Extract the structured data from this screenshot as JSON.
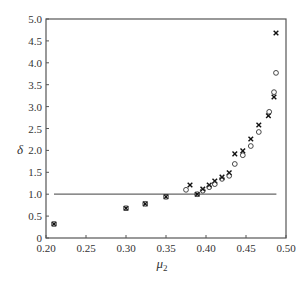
{
  "chart_data": {
    "type": "scatter",
    "title": "",
    "xlabel": "μ2",
    "ylabel": "δ",
    "xlim": [
      0.2,
      0.5
    ],
    "ylim": [
      0,
      5.0
    ],
    "x_ticks": [
      "0.20",
      "0.25",
      "0.30",
      "0.35",
      "0.40",
      "0.45",
      "0.50"
    ],
    "y_ticks": [
      "0",
      "0.5",
      "1.0",
      "1.5",
      "2.0",
      "2.5",
      "3.0",
      "3.5",
      "4.0",
      "4.5",
      "5.0"
    ],
    "grid": false,
    "legend": null,
    "reference_line": {
      "y": 1.0,
      "x_from": 0.21,
      "x_to": 0.488
    },
    "series": [
      {
        "name": "cross",
        "marker": "x",
        "points": [
          [
            0.21,
            0.32
          ],
          [
            0.3,
            0.68
          ],
          [
            0.324,
            0.78
          ],
          [
            0.35,
            0.94
          ],
          [
            0.38,
            1.21
          ],
          [
            0.389,
            1.0
          ],
          [
            0.396,
            1.12
          ],
          [
            0.404,
            1.21
          ],
          [
            0.411,
            1.3
          ],
          [
            0.42,
            1.39
          ],
          [
            0.429,
            1.49
          ],
          [
            0.436,
            1.92
          ],
          [
            0.446,
            1.99
          ],
          [
            0.456,
            2.26
          ],
          [
            0.466,
            2.58
          ],
          [
            0.478,
            2.79
          ],
          [
            0.485,
            3.22
          ],
          [
            0.4875,
            4.68
          ]
        ]
      },
      {
        "name": "circle",
        "marker": "o",
        "points": [
          [
            0.21,
            0.32
          ],
          [
            0.3,
            0.68
          ],
          [
            0.324,
            0.78
          ],
          [
            0.35,
            0.94
          ],
          [
            0.375,
            1.1
          ],
          [
            0.389,
            1.0
          ],
          [
            0.396,
            1.08
          ],
          [
            0.404,
            1.16
          ],
          [
            0.411,
            1.23
          ],
          [
            0.42,
            1.35
          ],
          [
            0.429,
            1.42
          ],
          [
            0.436,
            1.69
          ],
          [
            0.446,
            1.89
          ],
          [
            0.456,
            2.1
          ],
          [
            0.466,
            2.42
          ],
          [
            0.479,
            2.88
          ],
          [
            0.485,
            3.33
          ],
          [
            0.4875,
            3.77
          ]
        ]
      }
    ]
  }
}
